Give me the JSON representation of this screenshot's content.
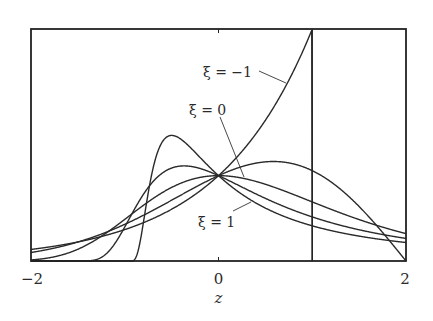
{
  "chart_data": {
    "type": "line",
    "title": "",
    "xlabel": "z",
    "ylabel": "",
    "xlim": [
      -2,
      2
    ],
    "ylim": [
      0,
      1.0
    ],
    "grid": false,
    "xticks": [
      {
        "value": -2,
        "label": "−2"
      },
      {
        "value": 0,
        "label": "0"
      },
      {
        "value": 2,
        "label": "2"
      }
    ],
    "function": "GEV density g(z) = t^(-1/xi - 1) * exp(-t^(-1/xi)), t = 1 + xi*z (Gumbel when xi = 0)",
    "series": [
      {
        "name": "xi=-1",
        "xi": -1,
        "label": "ξ = −1",
        "labeled": true
      },
      {
        "name": "xi=-0.5",
        "xi": -0.5,
        "label": "",
        "labeled": false
      },
      {
        "name": "xi=0",
        "xi": 0,
        "label": "ξ = 0",
        "labeled": true
      },
      {
        "name": "xi=0.5",
        "xi": 0.5,
        "label": "",
        "labeled": false
      },
      {
        "name": "xi=1",
        "xi": 1,
        "label": "ξ = 1",
        "labeled": true
      }
    ],
    "sample_points": {
      "xi=-1": {
        "z": [
          -2,
          -1,
          0,
          0.5,
          1
        ],
        "g": [
          0.05,
          0.135,
          0.368,
          0.607,
          1.0
        ]
      },
      "xi=-0.5": {
        "z": [
          -2,
          0,
          0.586,
          2
        ],
        "g": [
          0.037,
          0.368,
          0.429,
          0.0
        ]
      },
      "xi=0": {
        "z": [
          -2,
          0,
          2
        ],
        "g": [
          0.005,
          0.368,
          0.118
        ]
      },
      "xi=0.5": {
        "z": [
          -1,
          -0.367,
          0,
          2
        ],
        "g": [
          0.147,
          0.41,
          0.368,
          0.097
        ]
      },
      "xi=1": {
        "z": [
          -1,
          -0.5,
          0,
          2
        ],
        "g": [
          0.0,
          0.541,
          0.368,
          0.08
        ]
      }
    },
    "reference_lines": [
      {
        "orientation": "vertical",
        "z": 1
      }
    ],
    "annotations": [
      {
        "text": "ξ = −1",
        "points_to": "xi=-1"
      },
      {
        "text": "ξ = 0",
        "points_to": "xi=0"
      },
      {
        "text": "ξ = 1",
        "points_to": "xi=1"
      }
    ]
  }
}
